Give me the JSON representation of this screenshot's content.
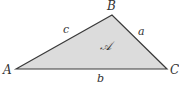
{
  "diagram": {
    "type": "triangle",
    "vertices": [
      {
        "label": "A",
        "x": 16,
        "y": 69
      },
      {
        "label": "B",
        "x": 112,
        "y": 15
      },
      {
        "label": "C",
        "x": 167,
        "y": 69
      }
    ],
    "sides": [
      {
        "label": "c",
        "from": "A",
        "to": "B"
      },
      {
        "label": "a",
        "from": "B",
        "to": "C"
      },
      {
        "label": "b",
        "from": "A",
        "to": "C"
      }
    ],
    "area_label": "𝒜",
    "colors": {
      "fill": "#dcdcdc",
      "stroke": "#3a3a3a",
      "text": "#333333"
    }
  },
  "labels": {
    "A": "A",
    "B": "B",
    "C": "C",
    "a": "a",
    "b": "b",
    "c": "c",
    "area": "𝒜"
  }
}
